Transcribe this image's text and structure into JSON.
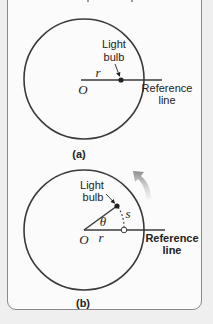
{
  "figure": {
    "colors": {
      "stroke": "#3a3a3a",
      "background": "#efefef",
      "panel": "#fbfbfb",
      "panel_border": "#8a8a8a",
      "arrow": "#8c8c8c"
    },
    "diagram_a": {
      "caption": "(a)",
      "light_label_line1": "Light",
      "light_label_line2": "bulb",
      "radius_label": "r",
      "origin_label": "O",
      "reference_label_line1": "Reference",
      "reference_label_line2": "line"
    },
    "diagram_b": {
      "caption": "(b)",
      "light_label_line1": "Light",
      "light_label_line2": "bulb",
      "angle_label": "θ",
      "arc_label": "s",
      "radius_label": "r",
      "origin_label": "O",
      "reference_label_line1": "Reference",
      "reference_label_line2": "line"
    }
  }
}
